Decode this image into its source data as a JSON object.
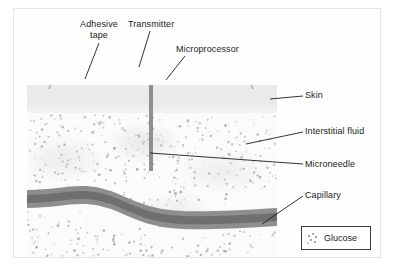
{
  "figure": {
    "type": "diagram",
    "labels": {
      "adhesive_tape": "Adhesive\ntape",
      "transmitter": "Transmitter",
      "microprocessor": "Microprocessor",
      "skin": "Skin",
      "interstitial_fluid": "Interstitial fluid",
      "microneedle": "Microneedle",
      "capillary": "Capillary"
    },
    "legend": {
      "entry_label": "Glucose",
      "marker": "scattered-dots"
    },
    "colors": {
      "skin_layer": "#e9e9ea",
      "interstitial_fluid": "#fbfbfb",
      "capillary_wall": "#8e8e8e",
      "capillary_lumen": "#6f6f6f",
      "device_body": "#8d8d8d",
      "transmitter": "#8a8a8a",
      "needle": "#8f8f8f",
      "adhesive_tape": "#e0e0e0",
      "leader_line": "#1c1c1c",
      "legend_border": "#3a3a3a",
      "frame": "#e6e6e6"
    }
  }
}
